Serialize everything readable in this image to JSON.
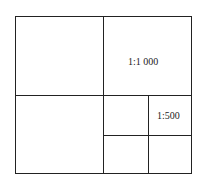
{
  "diagram": {
    "type": "map-sheet-division",
    "cells": [
      {
        "id": "q1",
        "label": ""
      },
      {
        "id": "q2",
        "label": "1:1 000"
      },
      {
        "id": "q3",
        "label": ""
      },
      {
        "id": "q4-sub1",
        "label": ""
      },
      {
        "id": "q4-sub2",
        "label": "1:500"
      },
      {
        "id": "q4-sub3",
        "label": ""
      },
      {
        "id": "q4-sub4",
        "label": ""
      }
    ],
    "labels": {
      "scale_1000": "1:1 000",
      "scale_500": "1:500"
    },
    "line_color": "#222222"
  }
}
